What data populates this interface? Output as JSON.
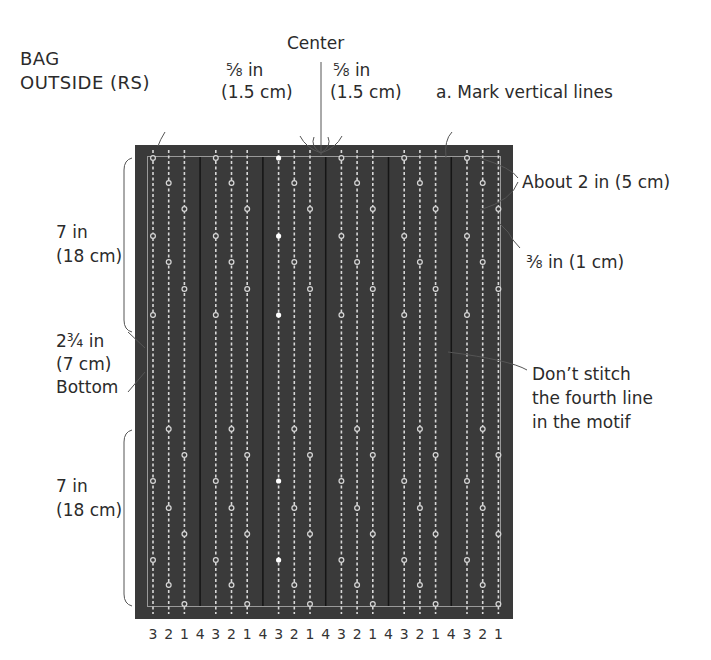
{
  "labels": {
    "title_line1": "BAG",
    "title_line2": "OUTSIDE (RS)",
    "center": "Center",
    "left_margin_in": "⅝ in",
    "left_margin_cm": "(1.5 cm)",
    "right_margin_in": "⅝ in",
    "right_margin_cm": "(1.5 cm)",
    "step_a": "a. Mark vertical lines",
    "spacing": "About 2 in (5 cm)",
    "edge": "⅜ in (1 cm)",
    "top_height_in": "7 in",
    "top_height_cm": "(18 cm)",
    "bottom_in": "2¾ in",
    "bottom_cm": "(7 cm)",
    "bottom_label": "Bottom",
    "lower_height_in": "7 in",
    "lower_height_cm": "(18 cm)",
    "dont_stitch_1": "Don’t stitch",
    "dont_stitch_2": "the fourth line",
    "dont_stitch_3": "in the motif"
  },
  "colors": {
    "fabric": "#3a3a3a",
    "fabric_edge": "#2e2e2e",
    "stitch": "#d8d8d8",
    "unstitched_line": "#151515",
    "outline": "#9a9a9a",
    "leader": "#555555"
  },
  "line_numbers": [
    "3",
    "2",
    "1",
    "4",
    "3",
    "2",
    "1",
    "4",
    "3",
    "2",
    "1",
    "4",
    "3",
    "2",
    "1",
    "4",
    "3",
    "2",
    "1",
    "4",
    "3",
    "2",
    "1"
  ],
  "center_line_index": 8
}
